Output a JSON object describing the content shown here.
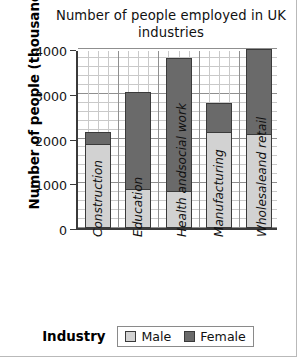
{
  "chart_data": {
    "type": "bar",
    "subtype": "stacked-bar",
    "title": "Number of people employed in UK industries",
    "xlabel": "Industry",
    "ylabel": "Number of people (thousands)",
    "categories": [
      "Construction",
      "Education",
      "Health and social work",
      "Manufacturing",
      "Wholesale and retail"
    ],
    "category_lines": [
      [
        "Construction"
      ],
      [
        "Education"
      ],
      [
        "Health and",
        "social work"
      ],
      [
        "Manufacturing"
      ],
      [
        "Wholesale",
        "and retail"
      ]
    ],
    "series": [
      {
        "name": "Male",
        "color": "#d2d2d2",
        "values": [
          1900,
          850,
          800,
          2150,
          2100
        ]
      },
      {
        "name": "Female",
        "color": "#6a6a6a",
        "values": [
          250,
          2200,
          3000,
          650,
          1900
        ]
      }
    ],
    "totals": [
      2150,
      3050,
      3800,
      2800,
      4000
    ],
    "ylim": [
      0,
      4000
    ],
    "yticks": [
      0,
      1000,
      2000,
      3000,
      4000
    ],
    "ytick_labels": [
      "0",
      "1000",
      "2000",
      "3000",
      "4000"
    ],
    "y_minor_step": 200,
    "grid": true,
    "legend_position": "bottom"
  },
  "legend": {
    "items": [
      {
        "label": "Male",
        "color": "#d2d2d2"
      },
      {
        "label": "Female",
        "color": "#6a6a6a"
      }
    ]
  }
}
